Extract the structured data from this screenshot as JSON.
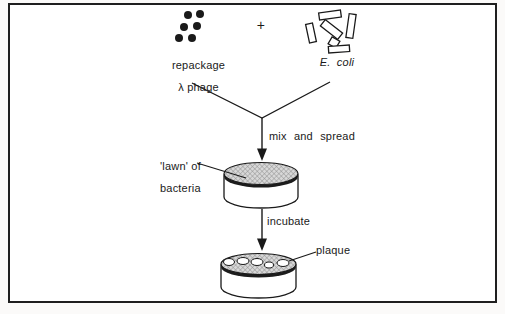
{
  "labels": {
    "phage_line1": "repackage",
    "phage_line2": "λ phage",
    "plus": "+",
    "ecoli": "E. coli",
    "mix": "mix and spread",
    "lawn_line1": "'lawn' of",
    "lawn_line2": "bacteria",
    "incubate": "incubate",
    "plaque": "plaque"
  },
  "colors": {
    "ink": "#1a1a1a",
    "lawn_fill": "#d8d8d8",
    "hatch_line": "#8f8f8f",
    "rim": "#1c1c1c",
    "dish_fill": "#ffffff",
    "frame": "#1f1f1f",
    "background": "#ffffff"
  },
  "shapes": {
    "dot_radius": 4,
    "phage_dots": [
      [
        188,
        15
      ],
      [
        200,
        14
      ],
      [
        184,
        27
      ],
      [
        197,
        26
      ],
      [
        179,
        38
      ],
      [
        192,
        38
      ]
    ],
    "ecoli_cells": [
      {
        "cx": 330,
        "cy": 15,
        "w": 22,
        "h": 7,
        "rot": -8
      },
      {
        "cx": 351,
        "cy": 26,
        "w": 7,
        "h": 24,
        "rot": 8
      },
      {
        "cx": 331.5,
        "cy": 29.5,
        "w": 22,
        "h": 8,
        "rot": 38
      },
      {
        "cx": 311,
        "cy": 33,
        "w": 7,
        "h": 19,
        "rot": -12
      },
      {
        "cx": 334,
        "cy": 42.5,
        "w": 9,
        "h": 8,
        "rot": 30
      },
      {
        "cx": 339,
        "cy": 49,
        "w": 21,
        "h": 6.5,
        "rot": -4
      }
    ],
    "plaques": [
      {
        "cx": 229,
        "cy": 262,
        "rx": 5.5,
        "ry": 3.5
      },
      {
        "cx": 243,
        "cy": 261,
        "rx": 6,
        "ry": 3.5
      },
      {
        "cx": 257,
        "cy": 262,
        "rx": 6,
        "ry": 3.5
      },
      {
        "cx": 269,
        "cy": 265,
        "rx": 4.5,
        "ry": 3
      },
      {
        "cx": 283,
        "cy": 263,
        "rx": 6,
        "ry": 3.5
      }
    ]
  }
}
